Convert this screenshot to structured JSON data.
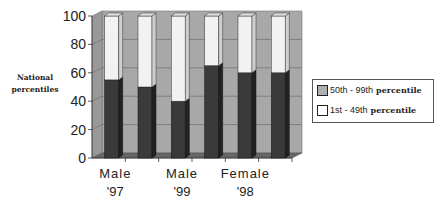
{
  "chart_data": {
    "type": "bar",
    "stacked": true,
    "three_d": true,
    "title": "",
    "xlabel": "",
    "ylabel": "National percentiles",
    "ylim": [
      0,
      100
    ],
    "yticks": [
      0,
      20,
      40,
      60,
      80,
      100
    ],
    "x_tick_labels": [
      {
        "line1": "Male",
        "line2": "'97"
      },
      {
        "line1": "Male",
        "line2": "'99"
      },
      {
        "line1": "Female",
        "line2": "'98"
      }
    ],
    "categories": [
      "Bar 1",
      "Bar 2",
      "Bar 3",
      "Bar 4",
      "Bar 5",
      "Bar 6"
    ],
    "series": [
      {
        "name": "50th - 99th percentile",
        "color": "#3a3a3a",
        "values": [
          55,
          50,
          40,
          65,
          60,
          60
        ]
      },
      {
        "name": "1st - 49th percentile",
        "color": "#f2f2f2",
        "values": [
          45,
          50,
          60,
          35,
          40,
          40
        ]
      }
    ],
    "legend_position": "right",
    "grid": true
  },
  "legend": {
    "items": [
      {
        "prefix": "50th - 99th",
        "suffix": "percentile",
        "color": "#b0b0b0"
      },
      {
        "prefix": "1st - 49th",
        "suffix": "percentile",
        "color": "#ffffff"
      }
    ]
  },
  "ylabel": {
    "line1": "National",
    "line2": "percentiles"
  }
}
